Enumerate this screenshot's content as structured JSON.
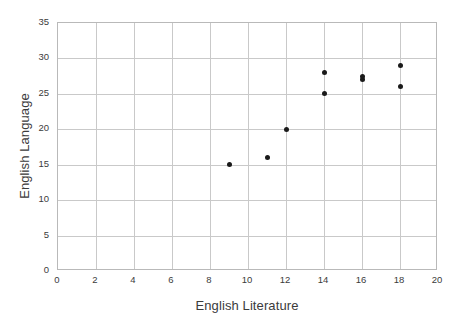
{
  "chart_data": {
    "type": "scatter",
    "title": "",
    "xlabel": "English Literature",
    "ylabel": "English Language",
    "xlim": [
      0,
      20
    ],
    "ylim": [
      0,
      35
    ],
    "xticks": [
      0,
      2,
      4,
      6,
      8,
      10,
      12,
      14,
      16,
      18,
      20
    ],
    "yticks": [
      0,
      5,
      10,
      15,
      20,
      25,
      30,
      35
    ],
    "grid": true,
    "legend": false,
    "point_color": "#1a1a1a",
    "grid_color": "#c9c9c9",
    "frame_color": "#b9b9b9",
    "points": [
      {
        "x": 9,
        "y": 15
      },
      {
        "x": 11,
        "y": 16
      },
      {
        "x": 12,
        "y": 20
      },
      {
        "x": 14,
        "y": 25
      },
      {
        "x": 14,
        "y": 28
      },
      {
        "x": 16,
        "y": 27
      },
      {
        "x": 16,
        "y": 27.5
      },
      {
        "x": 18,
        "y": 26
      },
      {
        "x": 18,
        "y": 29
      }
    ]
  }
}
